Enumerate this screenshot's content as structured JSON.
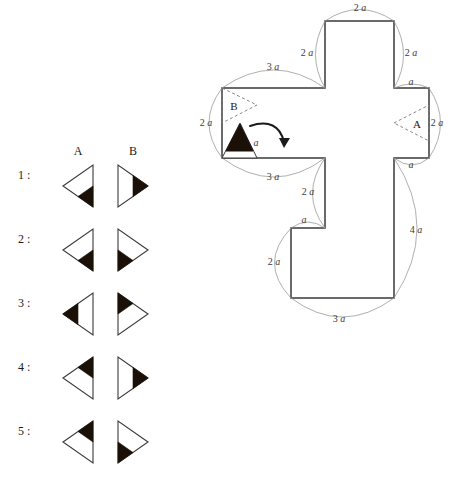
{
  "options_panel": {
    "column_headers": [
      {
        "id": "A",
        "label": "A",
        "x": 68,
        "y": 144
      },
      {
        "id": "B",
        "label": "B",
        "x": 123,
        "y": 144
      }
    ],
    "rows": [
      {
        "number": "1 :",
        "label_x": 18,
        "label_y": 168,
        "cx_a": 78,
        "cx_b": 133,
        "cy": 186,
        "A": {
          "orientation": "left",
          "shaded": "bottom-right-corner"
        },
        "B": {
          "orientation": "right",
          "shaded": "right-point"
        }
      },
      {
        "number": "2 :",
        "label_x": 18,
        "label_y": 232,
        "cx_a": 78,
        "cx_b": 133,
        "cy": 250,
        "A": {
          "orientation": "left",
          "shaded": "bottom-right-corner"
        },
        "B": {
          "orientation": "right",
          "shaded": "bottom-left-corner"
        }
      },
      {
        "number": "3 :",
        "label_x": 18,
        "label_y": 296,
        "cx_a": 78,
        "cx_b": 133,
        "cy": 314,
        "A": {
          "orientation": "left",
          "shaded": "left-point"
        },
        "B": {
          "orientation": "right",
          "shaded": "top-left-corner"
        }
      },
      {
        "number": "4 :",
        "label_x": 18,
        "label_y": 360,
        "cx_a": 78,
        "cx_b": 133,
        "cy": 378,
        "A": {
          "orientation": "left",
          "shaded": "top-right-corner"
        },
        "B": {
          "orientation": "right",
          "shaded": "right-point"
        }
      },
      {
        "number": "5 :",
        "label_x": 18,
        "label_y": 424,
        "cx_a": 78,
        "cx_b": 133,
        "cy": 442,
        "A": {
          "orientation": "left",
          "shaded": "top-right-corner"
        },
        "B": {
          "orientation": "right",
          "shaded": "bottom-left-corner"
        }
      }
    ]
  },
  "figure": {
    "net_outline_points": "325,21 394,21 394,88 429,88 429,158 394,158 394,298 291,298 291,228 325,228 325,158 222,158 222,88 325,88",
    "labels": {
      "triangle_A": "A",
      "triangle_B": "B"
    },
    "dimensions": [
      {
        "id": "top-arm-width",
        "text": "2 a",
        "x": 360,
        "y": 11
      },
      {
        "id": "top-arm-left",
        "text": "2 a",
        "x": 307,
        "y": 56
      },
      {
        "id": "top-arm-right",
        "text": "2 a",
        "x": 411,
        "y": 56
      },
      {
        "id": "upper-left-top",
        "text": "3 a",
        "x": 273,
        "y": 70
      },
      {
        "id": "right-arm-top",
        "text": "a",
        "x": 411,
        "y": 85
      },
      {
        "id": "left-arm-height",
        "text": "2 a",
        "x": 206,
        "y": 126
      },
      {
        "id": "right-arm-height",
        "text": "2 a",
        "x": 437,
        "y": 126
      },
      {
        "id": "black-tri-side",
        "text": "a",
        "x": 256,
        "y": 146
      },
      {
        "id": "lower-left-bottom",
        "text": "3 a",
        "x": 273,
        "y": 180
      },
      {
        "id": "right-arm-bottom",
        "text": "a",
        "x": 411,
        "y": 168
      },
      {
        "id": "notch-vertical",
        "text": "2 a",
        "x": 308,
        "y": 195
      },
      {
        "id": "notch-horizontal",
        "text": "a",
        "x": 304,
        "y": 223
      },
      {
        "id": "left-lower-height",
        "text": "2 a",
        "x": 274,
        "y": 265
      },
      {
        "id": "right-lower-height",
        "text": "4 a",
        "x": 416,
        "y": 233
      },
      {
        "id": "bottom-width",
        "text": "3 a",
        "x": 339,
        "y": 322
      }
    ]
  },
  "colors": {
    "stroke": "#3a3a3a",
    "fill_black": "#1a1008",
    "dim_arc": "#9a9a9a",
    "text": "#1a1a1a",
    "background": "#ffffff"
  }
}
